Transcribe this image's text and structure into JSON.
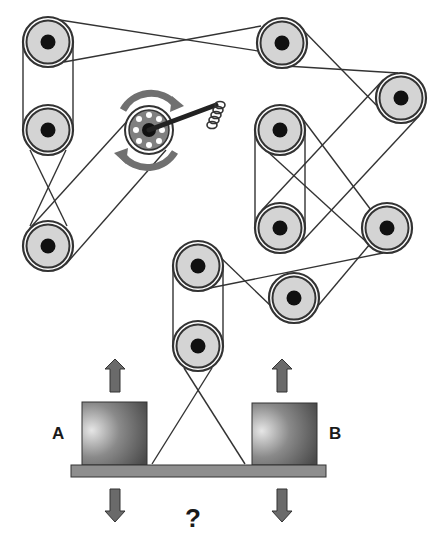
{
  "diagram": {
    "labels": {
      "box_a": "A",
      "box_b": "B",
      "question": "?"
    },
    "colors": {
      "pulley_fill": "#d4d4d4",
      "pulley_stroke": "#333333",
      "hub": "#111111",
      "belt": "#333333",
      "box_dark": "#555555",
      "box_light": "#dcdcdc",
      "arrow": "#6a6a6a",
      "plank": "#8e8e8e"
    },
    "pulleys": [
      {
        "id": "p1",
        "x": 48,
        "y": 42
      },
      {
        "id": "p2",
        "x": 48,
        "y": 130
      },
      {
        "id": "p3",
        "x": 48,
        "y": 246
      },
      {
        "id": "p4",
        "x": 282,
        "y": 43
      },
      {
        "id": "p5",
        "x": 401,
        "y": 98
      },
      {
        "id": "p6",
        "x": 280,
        "y": 130
      },
      {
        "id": "p7",
        "x": 280,
        "y": 228
      },
      {
        "id": "p8",
        "x": 387,
        "y": 228
      },
      {
        "id": "p9",
        "x": 198,
        "y": 266
      },
      {
        "id": "p10",
        "x": 294,
        "y": 298
      },
      {
        "id": "p11",
        "x": 198,
        "y": 346
      }
    ],
    "crank": {
      "x": 149,
      "y": 130,
      "rotation": "both directions"
    }
  }
}
